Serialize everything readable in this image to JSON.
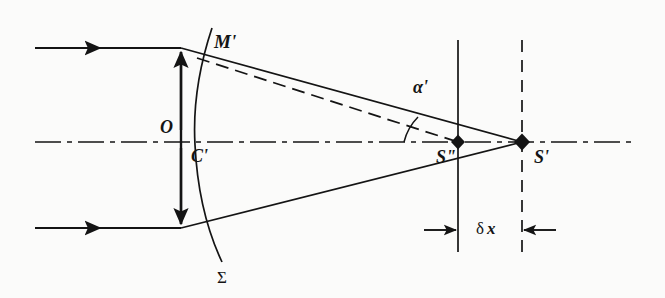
{
  "figure": {
    "kind": "optics-ray-diagram",
    "background_color": "#fbfbfa",
    "ink_color": "#141414",
    "width": 665,
    "height": 298
  },
  "labels": {
    "wavefront_point": "M'",
    "aperture_semidiameter": "O",
    "wavefront_center": "C'",
    "wavefront_surface": "Σ",
    "convergence_angle": "α'",
    "marginal_focus": "S\"",
    "paraxial_focus": "S'",
    "longitudinal_defect_delta": "δ",
    "longitudinal_defect_var": "x"
  },
  "elements": {
    "optical_axis": "dash-dot horizontal axis",
    "incoming_ray_top": "arrowed parallel ray entering from left, upper",
    "incoming_ray_bottom": "arrowed parallel ray entering from left, lower",
    "aperture_arrow": "double-headed vertical arrow marking aperture height O",
    "wavefront_curve": "curved aberrated wavefront sigma",
    "ray_upper_solid": "refracted marginal ray M' to S'",
    "ray_upper_dashed": "ideal reference ray M' to S''",
    "ray_lower_solid": "refracted lower marginal ray to S'",
    "vertical_line_marginal": "solid vertical reference line through S''",
    "vertical_line_paraxial": "dashed vertical reference line through S'",
    "angle_arc": "arc marking angle alpha prime at S''",
    "dimension_arrows": "inward-pointing dimension arrows bracketing delta x",
    "focus_marker_marginal": "diamond point marker at S''",
    "focus_marker_paraxial": "diamond point marker at S'"
  },
  "geometry": {
    "axis_y": 142,
    "axis_x_start": 35,
    "axis_x_end": 636,
    "vertex_x": 181,
    "ray_top_y": 48,
    "ray_bottom_y": 228,
    "ray_x_start": 35,
    "s_double_prime_x": 458,
    "s_prime_x": 522,
    "vline_top_y": 40,
    "vline_bottom_y": 252,
    "dim_arrow_y": 230,
    "wavefront_top": [
      212,
      28
    ],
    "wavefront_mid": [
      195,
      142
    ],
    "wavefront_bottom": [
      222,
      262
    ]
  }
}
